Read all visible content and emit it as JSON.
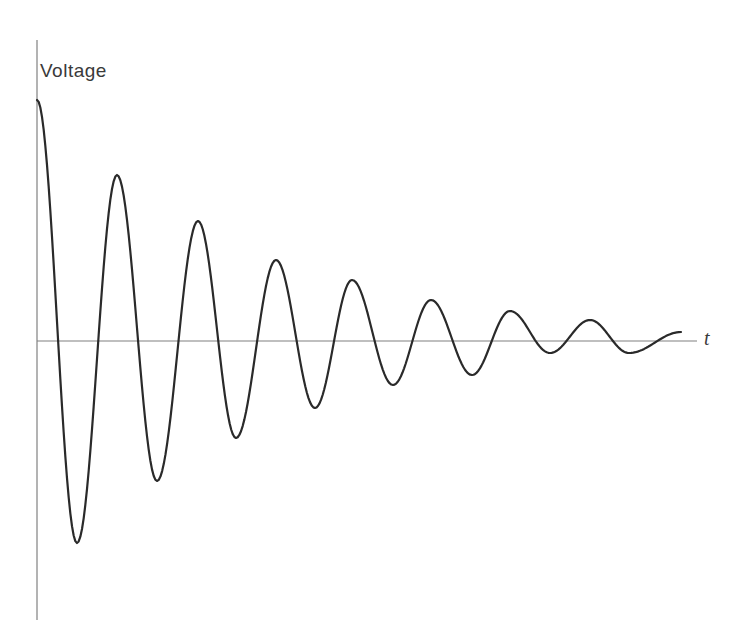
{
  "chart_data": {
    "type": "line",
    "title": "",
    "xlabel": "t",
    "ylabel": "Voltage",
    "grid": false,
    "legend": null,
    "axis_color": "#808080",
    "line_color": "#2a2a2a",
    "extrema": [
      {
        "kind": "start",
        "x": 37,
        "y": 100
      },
      {
        "kind": "trough",
        "x": 77,
        "y": 543
      },
      {
        "kind": "peak",
        "x": 117,
        "y": 175
      },
      {
        "kind": "trough",
        "x": 157,
        "y": 481
      },
      {
        "kind": "peak",
        "x": 198,
        "y": 221
      },
      {
        "kind": "trough",
        "x": 236,
        "y": 438
      },
      {
        "kind": "peak",
        "x": 276,
        "y": 260
      },
      {
        "kind": "trough",
        "x": 315,
        "y": 408
      },
      {
        "kind": "peak",
        "x": 352,
        "y": 280
      },
      {
        "kind": "trough",
        "x": 393,
        "y": 385
      },
      {
        "kind": "peak",
        "x": 431,
        "y": 300
      },
      {
        "kind": "trough",
        "x": 472,
        "y": 375
      },
      {
        "kind": "peak",
        "x": 510,
        "y": 311
      },
      {
        "kind": "trough",
        "x": 550,
        "y": 353
      },
      {
        "kind": "peak",
        "x": 590,
        "y": 320
      },
      {
        "kind": "trough",
        "x": 629,
        "y": 353
      },
      {
        "kind": "end",
        "x": 681,
        "y": 332
      }
    ],
    "axes": {
      "origin_x": 37,
      "baseline_y": 341,
      "y_top": 40,
      "y_bottom": 620,
      "x_end": 697
    }
  },
  "labels": {
    "y_axis": "Voltage",
    "x_axis": "t"
  }
}
